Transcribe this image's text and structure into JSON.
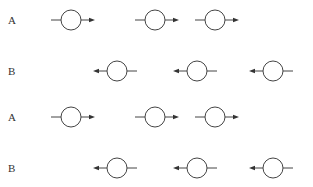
{
  "diagram": {
    "rows": [
      {
        "label": "A",
        "y": 20,
        "direction": "right",
        "circles": [
          71,
          155,
          215
        ]
      },
      {
        "label": "B",
        "y": 71,
        "direction": "left",
        "circles": [
          117,
          197,
          273
        ]
      },
      {
        "label": "A",
        "y": 117,
        "direction": "right",
        "circles": [
          71,
          155,
          215
        ]
      },
      {
        "label": "B",
        "y": 168,
        "direction": "left",
        "circles": [
          117,
          197,
          273
        ]
      }
    ],
    "circle_radius": 10,
    "stroke_color": "#444444"
  }
}
